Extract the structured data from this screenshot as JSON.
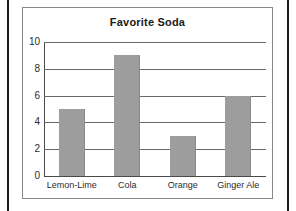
{
  "chart_data": {
    "type": "bar",
    "title": "Favorite Soda",
    "xlabel": "",
    "ylabel": "",
    "categories": [
      "Lemon-Lime",
      "Cola",
      "Orange",
      "Ginger Ale"
    ],
    "values": [
      5,
      9,
      3,
      6
    ],
    "ylim": [
      0,
      10
    ],
    "ytick_labels": [
      "0",
      "2",
      "4",
      "6",
      "8",
      "10"
    ],
    "ytick_values": [
      0,
      2,
      4,
      6,
      8,
      10
    ],
    "grid": true,
    "legend": false,
    "bar_color": "#9d9d9d",
    "gridline_color": "#6a6a6a",
    "axis_color": "#4a4a4a",
    "panel_border_color": "#888888",
    "text_color": "#1b1b1b"
  }
}
